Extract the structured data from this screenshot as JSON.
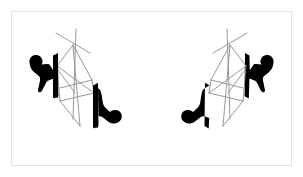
{
  "figure": {
    "title": "Stereo pair of mirror-symmetric wireframe prisms with solid silhouette markers",
    "kind": "line-diagram",
    "caption": "",
    "canvas": {
      "width": 303,
      "height": 177,
      "background_color": "#ffffff"
    },
    "frame": {
      "label": "figure-border",
      "x": 11,
      "y": 11,
      "width": 281,
      "height": 155,
      "stroke_color": "#e0e0e0",
      "stroke_width": 1,
      "fill_color": "#ffffff"
    },
    "style": {
      "wireframe_stroke_color": "#8c8c8c",
      "wireframe_stroke_width": 1,
      "silhouette_fill_color": "#000000",
      "slab_fill_color": "#000000"
    },
    "panels": [
      {
        "id": "left-panel",
        "label": "Left stereo view",
        "mirrored": false,
        "wireframe": {
          "label": "left-wireframe-prism",
          "vertices": {
            "apex": [
              73,
              45
            ],
            "top_front": [
              74,
              48
            ],
            "upper_left": [
              58,
              66
            ],
            "upper_right": [
              92,
              80
            ],
            "mid_center": [
              74,
              92
            ],
            "lower_left": [
              60,
              100
            ],
            "lower_right": [
              93,
              92
            ],
            "bottom_center": [
              79,
              125
            ],
            "bottom_left": [
              57,
              96
            ],
            "spike_nw": [
              57,
              33
            ],
            "spike_ne": [
              89,
              53
            ],
            "spike_n": [
              76,
              30
            ],
            "spike_s": [
              73,
              118
            ]
          },
          "edges": [
            [
              "spike_nw",
              "spike_ne"
            ],
            [
              "spike_n",
              "spike_s"
            ],
            [
              "apex",
              "upper_left"
            ],
            [
              "apex",
              "upper_right"
            ],
            [
              "apex",
              "mid_center"
            ],
            [
              "upper_left",
              "lower_left"
            ],
            [
              "upper_right",
              "lower_right"
            ],
            [
              "upper_left",
              "mid_center"
            ],
            [
              "mid_center",
              "upper_right"
            ],
            [
              "lower_left",
              "mid_center"
            ],
            [
              "mid_center",
              "lower_right"
            ],
            [
              "lower_left",
              "bottom_center"
            ],
            [
              "lower_right",
              "bottom_center"
            ],
            [
              "apex",
              "bottom_center"
            ]
          ]
        },
        "silhouettes": [
          {
            "label": "left-outer-silhouette",
            "position": "outer-left",
            "anchor": [
              30,
              60
            ],
            "fill_color": "#000000"
          },
          {
            "label": "left-inner-silhouette",
            "position": "inner-right",
            "anchor": [
              92,
              88
            ],
            "fill_color": "#000000"
          }
        ],
        "slabs": [
          {
            "label": "left-outer-slab",
            "fill_color": "#000000",
            "x1": 53,
            "y1": 55,
            "x2": 58,
            "y2": 96
          },
          {
            "label": "left-inner-slab",
            "fill_color": "#000000",
            "x1": 93,
            "y1": 85,
            "x2": 98,
            "y2": 126
          }
        ]
      },
      {
        "id": "right-panel",
        "label": "Right stereo view",
        "mirrored": true,
        "wireframe": {
          "label": "right-wireframe-prism",
          "vertices": {
            "apex": [
              230,
              45
            ],
            "top_front": [
              229,
              48
            ],
            "upper_left": [
              245,
              66
            ],
            "upper_right": [
              211,
              80
            ],
            "mid_center": [
              229,
              92
            ],
            "lower_left": [
              243,
              100
            ],
            "lower_right": [
              210,
              92
            ],
            "bottom_center": [
              224,
              125
            ],
            "bottom_left": [
              246,
              96
            ],
            "spike_nw": [
              246,
              33
            ],
            "spike_ne": [
              214,
              53
            ],
            "spike_n": [
              227,
              30
            ],
            "spike_s": [
              230,
              118
            ]
          },
          "edges": [
            [
              "spike_nw",
              "spike_ne"
            ],
            [
              "spike_n",
              "spike_s"
            ],
            [
              "apex",
              "upper_left"
            ],
            [
              "apex",
              "upper_right"
            ],
            [
              "apex",
              "mid_center"
            ],
            [
              "upper_left",
              "lower_left"
            ],
            [
              "upper_right",
              "lower_right"
            ],
            [
              "upper_left",
              "mid_center"
            ],
            [
              "mid_center",
              "upper_right"
            ],
            [
              "lower_left",
              "mid_center"
            ],
            [
              "mid_center",
              "lower_right"
            ],
            [
              "lower_left",
              "bottom_center"
            ],
            [
              "lower_right",
              "bottom_center"
            ],
            [
              "apex",
              "bottom_center"
            ]
          ]
        },
        "silhouettes": [
          {
            "label": "right-outer-silhouette",
            "position": "outer-right",
            "anchor": [
              273,
              60
            ],
            "fill_color": "#000000"
          },
          {
            "label": "right-inner-silhouette",
            "position": "inner-left",
            "anchor": [
              211,
              88
            ],
            "fill_color": "#000000"
          }
        ],
        "slabs": [
          {
            "label": "right-outer-slab",
            "fill_color": "#000000",
            "x1": 245,
            "y1": 55,
            "x2": 250,
            "y2": 96
          },
          {
            "label": "right-inner-slab",
            "fill_color": "#000000",
            "x1": 205,
            "y1": 85,
            "x2": 210,
            "y2": 126
          }
        ]
      }
    ]
  }
}
